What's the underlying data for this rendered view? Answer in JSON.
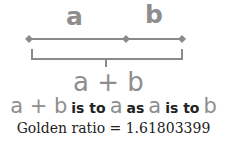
{
  "diagram": {
    "segment_labels": {
      "a": "a",
      "b": "b"
    },
    "sum_label": "a + b",
    "ratio_statement": {
      "parts": [
        "a + b",
        "is to",
        "a",
        "as",
        "a",
        "is to",
        "b"
      ]
    },
    "caption": "Golden ratio = 1.61803399",
    "colors": {
      "letters": "#8e8e8e",
      "line": "#8a8a8a",
      "words": "#222222"
    }
  }
}
